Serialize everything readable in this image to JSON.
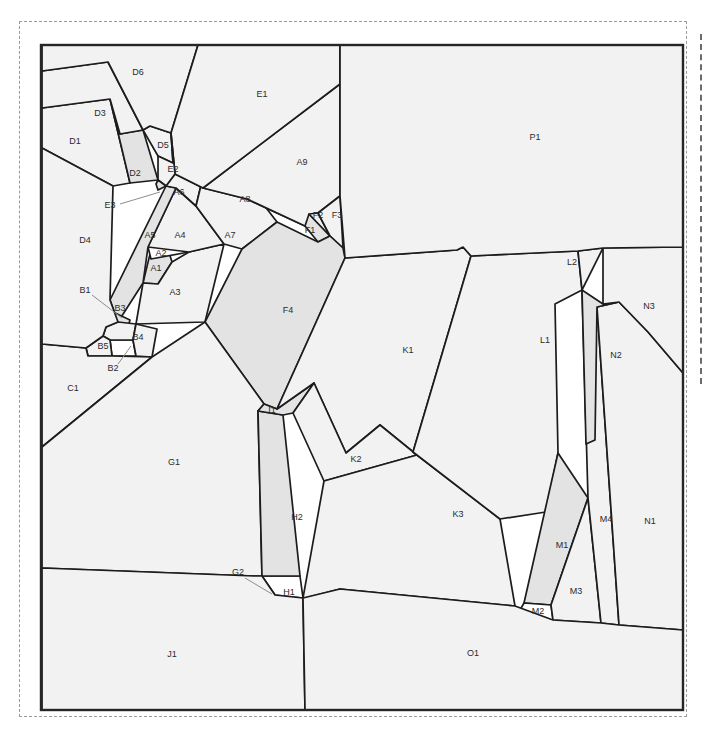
{
  "figure": {
    "type": "polygon-parcel-map",
    "sheet": {
      "width": 708,
      "height": 732
    },
    "frame": {
      "x": 41,
      "y": 45,
      "width": 642,
      "height": 665
    },
    "colors": {
      "line": "#1c1c1c",
      "frame": "#262626",
      "label": "#2b2b2b",
      "fill_light": "#f2f2f2",
      "fill_mid": "#e3e3e3",
      "fill_dark": "#c9c9c9",
      "fill_white": "#ffffff",
      "leader": "#8d8d8d",
      "sheet_border": "#9a9a9a",
      "background": "#ffffff"
    }
  },
  "regions": [
    {
      "id": "A1",
      "label": "A1",
      "shade": "mid",
      "lx": 156,
      "ly": 269,
      "leader": null,
      "points": "150,254 168,249 172,262 158,284 143,283"
    },
    {
      "id": "A2",
      "label": "A2",
      "shade": "white",
      "lx": 161,
      "ly": 254,
      "leader": null,
      "points": "148,247 186,240 189,252 151,259"
    },
    {
      "id": "A3",
      "label": "A3",
      "shade": "light",
      "lx": 175,
      "ly": 293,
      "leader": null,
      "points": "189,252 224,244 205,322 136,324 143,283 158,284 172,262"
    },
    {
      "id": "A4",
      "label": "A4",
      "shade": "light",
      "lx": 180,
      "ly": 236,
      "leader": null,
      "points": "176,188 196,206 224,244 189,252 148,247"
    },
    {
      "id": "A5",
      "label": "A5",
      "shade": "mid",
      "lx": 150,
      "ly": 236,
      "leader": null,
      "points": "166,186 176,188 148,247 143,283 118,322 110,300"
    },
    {
      "id": "A6",
      "label": "A6",
      "shade": "light",
      "lx": 179,
      "ly": 193,
      "leader": null,
      "points": "175,174 203,177 196,206 176,188 166,186"
    },
    {
      "id": "A7",
      "label": "A7",
      "shade": "light",
      "lx": 230,
      "ly": 236,
      "leader": null,
      "points": "203,177 247,183 277,222 242,249 224,244 196,206"
    },
    {
      "id": "A8",
      "label": "A8",
      "shade": "dark",
      "lx": 245,
      "ly": 200,
      "leader": null,
      "points": "175,174 203,177 247,183 309,214 305,226 247,199 203,188"
    },
    {
      "id": "A9",
      "label": "A9",
      "shade": "light",
      "lx": 302,
      "ly": 163,
      "leader": null,
      "points": "203,188 247,199 305,226 318,213 340,196 340,84"
    },
    {
      "id": "B1",
      "label": "B1",
      "shade": "mid",
      "lx": 85,
      "ly": 291,
      "leader": "92,295 122,318",
      "points": "113,312 130,320 126,334 110,327"
    },
    {
      "id": "B2",
      "label": "B2",
      "shade": "white",
      "lx": 113,
      "ly": 369,
      "leader": "118,364 131,346",
      "points": "110,340 133,340 136,356 112,356"
    },
    {
      "id": "B3",
      "label": "B3",
      "shade": "light",
      "lx": 120,
      "ly": 309,
      "leader": null,
      "points": "118,322 136,324 133,340 110,340 103,336 106,327"
    },
    {
      "id": "B4",
      "label": "B4",
      "shade": "light",
      "lx": 138,
      "ly": 338,
      "leader": null,
      "points": "136,324 157,329 152,357 136,356 133,340"
    },
    {
      "id": "B5",
      "label": "B5",
      "shade": "light",
      "lx": 103,
      "ly": 347,
      "leader": null,
      "points": "103,336 110,340 112,356 88,356 86,348"
    },
    {
      "id": "C1",
      "label": "C1",
      "shade": "light",
      "lx": 73,
      "ly": 389,
      "leader": null,
      "points": "42,344 86,348 88,356 112,356 152,357 42,447"
    },
    {
      "id": "D1",
      "label": "D1",
      "shade": "light",
      "lx": 75,
      "ly": 142,
      "leader": null,
      "points": "42,108 110,99 130,183 113,186 42,148"
    },
    {
      "id": "D2",
      "label": "D2",
      "shade": "mid",
      "lx": 135,
      "ly": 174,
      "leader": null,
      "points": "120,134 143,130 158,180 130,183 110,99"
    },
    {
      "id": "D3",
      "label": "D3",
      "shade": "light",
      "lx": 100,
      "ly": 114,
      "leader": null,
      "points": "42,71 108,62 143,130 120,134 110,99 42,108"
    },
    {
      "id": "D4",
      "label": "D4",
      "shade": "light",
      "lx": 85,
      "ly": 241,
      "leader": null,
      "points": "42,148 113,186 110,300 118,322 106,327 103,336 86,348 42,344"
    },
    {
      "id": "D5",
      "label": "D5",
      "shade": "light",
      "lx": 163,
      "ly": 146,
      "leader": null,
      "points": "150,126 171,133 173,163 158,156 143,130"
    },
    {
      "id": "D6",
      "label": "D6",
      "shade": "light",
      "lx": 138,
      "ly": 73,
      "leader": null,
      "points": "42,45 198,45 171,133 150,126 143,130 108,62 42,71"
    },
    {
      "id": "E1",
      "label": "E1",
      "shade": "light",
      "lx": 262,
      "ly": 95,
      "leader": null,
      "points": "198,45 340,45 340,84 203,188 175,174 171,133"
    },
    {
      "id": "E2",
      "label": "E2",
      "shade": "light",
      "lx": 173,
      "ly": 170,
      "leader": null,
      "points": "171,133 175,174 166,186 158,180 158,156 173,163"
    },
    {
      "id": "E3",
      "label": "E3",
      "shade": "mid",
      "lx": 110,
      "ly": 206,
      "leader": "120,204 160,192",
      "points": "158,180 166,186 158,190 156,184"
    },
    {
      "id": "F1",
      "label": "F1",
      "shade": "mid",
      "lx": 310,
      "ly": 231,
      "leader": null,
      "points": "305,226 309,214 330,236 318,242"
    },
    {
      "id": "F2",
      "label": "F2",
      "shade": "light",
      "lx": 318,
      "ly": 216,
      "leader": null,
      "points": "309,214 318,213 330,236"
    },
    {
      "id": "F3",
      "label": "F3",
      "shade": "light",
      "lx": 337,
      "ly": 216,
      "leader": null,
      "points": "318,213 340,196 343,248 330,236"
    },
    {
      "id": "F4",
      "label": "F4",
      "shade": "mid",
      "lx": 288,
      "ly": 311,
      "leader": null,
      "points": "242,249 277,222 318,242 330,236 343,248 345,258 277,409 264,404 205,322"
    },
    {
      "id": "G1",
      "label": "G1",
      "shade": "light",
      "lx": 174,
      "ly": 463,
      "leader": null,
      "points": "42,447 152,357 205,322 264,404 258,411 262,576 254,576 42,568"
    },
    {
      "id": "G2",
      "label": "G2",
      "shade": "white",
      "lx": 238,
      "ly": 573,
      "leader": "245,578 272,594",
      "points": "262,576 275,595 256,595"
    },
    {
      "id": "H1",
      "label": "H1",
      "shade": "white",
      "lx": 289,
      "ly": 593,
      "leader": null,
      "points": "262,576 300,576 303,598 275,595"
    },
    {
      "id": "H2",
      "label": "H2",
      "shade": "mid",
      "lx": 297,
      "ly": 518,
      "leader": null,
      "points": "258,411 283,415 300,576 262,576"
    },
    {
      "id": "I1",
      "label": "I1",
      "shade": "mid",
      "lx": 272,
      "ly": 411,
      "leader": null,
      "points": "264,404 277,409 314,383 293,413 283,415 258,411"
    },
    {
      "id": "J1",
      "label": "J1",
      "shade": "light",
      "lx": 172,
      "ly": 655,
      "leader": null,
      "points": "42,568 254,576 262,576 275,595 303,598 305,710 42,710"
    },
    {
      "id": "K1",
      "label": "K1",
      "shade": "light",
      "lx": 408,
      "ly": 351,
      "leader": null,
      "points": "345,258 457,250 463,247 471,256 413,452 380,425 346,453 314,383 277,409"
    },
    {
      "id": "K2",
      "label": "K2",
      "shade": "light",
      "lx": 356,
      "ly": 460,
      "leader": null,
      "points": "314,383 346,453 380,425 417,455 324,481 293,413"
    },
    {
      "id": "K3",
      "label": "K3",
      "shade": "light",
      "lx": 458,
      "ly": 515,
      "leader": null,
      "points": "324,481 417,455 413,452 500,519 515,606 340,589 305,598 303,598"
    },
    {
      "id": "L1",
      "label": "L1",
      "shade": "light",
      "lx": 545,
      "ly": 341,
      "leader": null,
      "points": "471,256 578,251 582,290 555,304 558,453 546,512 500,519 413,452"
    },
    {
      "id": "L2",
      "label": "L2",
      "shade": "light",
      "lx": 572,
      "ly": 263,
      "leader": null,
      "points": "578,251 603,248 582,290"
    },
    {
      "id": "M1",
      "label": "M1",
      "shade": "mid",
      "lx": 562,
      "ly": 546,
      "leader": null,
      "points": "558,453 588,498 551,605 524,603"
    },
    {
      "id": "M2",
      "label": "M2",
      "shade": "white",
      "lx": 538,
      "ly": 612,
      "leader": null,
      "points": "524,603 551,605 553,620 516,617"
    },
    {
      "id": "M3",
      "label": "M3",
      "shade": "light",
      "lx": 576,
      "ly": 592,
      "leader": null,
      "points": "588,498 601,623 553,620 551,605"
    },
    {
      "id": "M4",
      "label": "M4",
      "shade": "light",
      "lx": 606,
      "ly": 520,
      "leader": null,
      "points": "582,290 597,307 619,625 601,623 588,498"
    },
    {
      "id": "N1",
      "label": "N1",
      "shade": "light",
      "lx": 650,
      "ly": 522,
      "leader": null,
      "points": "619,302 648,332 683,373 683,630 619,625 597,307"
    },
    {
      "id": "N2",
      "label": "N2",
      "shade": "mid",
      "lx": 616,
      "ly": 356,
      "leader": null,
      "points": "582,290 603,304 619,302 597,307 595,440 586,444"
    },
    {
      "id": "N3",
      "label": "N3",
      "shade": "light",
      "lx": 649,
      "ly": 307,
      "leader": null,
      "points": "603,248 683,247 683,373 648,332 619,302 603,304"
    },
    {
      "id": "O1",
      "label": "O1",
      "shade": "light",
      "lx": 473,
      "ly": 654,
      "leader": null,
      "points": "305,710 303,598 340,589 515,606 553,620 601,623 619,625 683,630 683,710"
    },
    {
      "id": "P1",
      "label": "P1",
      "shade": "light",
      "lx": 535,
      "ly": 138,
      "leader": null,
      "points": "340,45 683,45 683,247 603,248 578,251 471,256 463,247 457,250 345,258 340,196 340,84"
    }
  ]
}
